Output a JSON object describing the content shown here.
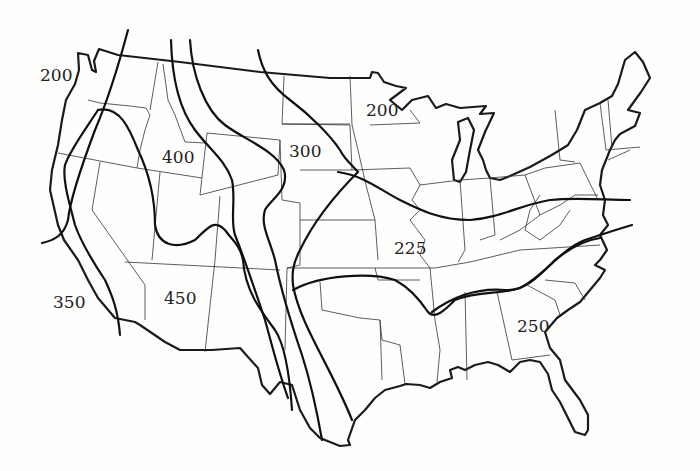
{
  "map": {
    "subject": "Contiguous United States contour map",
    "line_color": "#111111",
    "background": "#fefefc"
  },
  "contour_labels": [
    {
      "id": "c200-west",
      "value": "200",
      "x": 40,
      "y": 67
    },
    {
      "id": "c200-north",
      "value": "200",
      "x": 366,
      "y": 102
    },
    {
      "id": "c300",
      "value": "300",
      "x": 289,
      "y": 143
    },
    {
      "id": "c400",
      "value": "400",
      "x": 162,
      "y": 149
    },
    {
      "id": "c225",
      "value": "225",
      "x": 394,
      "y": 240
    },
    {
      "id": "c350",
      "value": "350",
      "x": 53,
      "y": 294
    },
    {
      "id": "c450",
      "value": "450",
      "x": 164,
      "y": 290
    },
    {
      "id": "c250",
      "value": "250",
      "x": 517,
      "y": 318
    }
  ]
}
